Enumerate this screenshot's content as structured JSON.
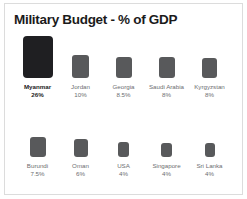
{
  "chart": {
    "title": "Military Budget - % of GDP"
  },
  "chart_data": {
    "type": "bar",
    "title": "Military Budget - % of GDP",
    "subtitle": "",
    "xlabel": "",
    "ylabel": "",
    "unit": "% of GDP",
    "grid": false,
    "legend": "none",
    "note": "Proportional-area square chart; square area scales with value. Countries arranged in two rows of five, ordered descending by value. Myanmar is highlighted in near-black; all other squares are medium gray.",
    "categories": [
      "Myanmar",
      "Jordan",
      "Georgia",
      "Saudi Arabia",
      "Kyrgyzstan",
      "Burundi",
      "Oman",
      "USA",
      "Singapore",
      "Sri Lanka"
    ],
    "values": [
      26,
      10,
      8.5,
      8,
      8,
      7.5,
      6,
      4,
      4,
      4
    ],
    "value_labels": [
      "26%",
      "10%",
      "8.5%",
      "8%",
      "8%",
      "7.5%",
      "6%",
      "4%",
      "4%",
      "4%"
    ],
    "ylim": [
      0,
      26
    ],
    "rows": [
      {
        "items": [
          {
            "label": "Myanmar",
            "value": 26,
            "value_label": "26%",
            "w": 30,
            "h": 42,
            "highlight": true
          },
          {
            "label": "Jordan",
            "value": 10,
            "value_label": "10%",
            "w": 17,
            "h": 23,
            "highlight": false
          },
          {
            "label": "Georgia",
            "value": 8.5,
            "value_label": "8.5%",
            "w": 16,
            "h": 21,
            "highlight": false
          },
          {
            "label": "Saudi Arabia",
            "value": 8,
            "value_label": "8%",
            "w": 16,
            "h": 21,
            "highlight": false
          },
          {
            "label": "Kyrgyzstan",
            "value": 8,
            "value_label": "8%",
            "w": 15,
            "h": 20,
            "highlight": false
          }
        ]
      },
      {
        "items": [
          {
            "label": "Burundi",
            "value": 7.5,
            "value_label": "7.5%",
            "w": 16,
            "h": 20,
            "highlight": false
          },
          {
            "label": "Oman",
            "value": 6,
            "value_label": "6%",
            "w": 14,
            "h": 18,
            "highlight": false
          },
          {
            "label": "USA",
            "value": 4,
            "value_label": "4%",
            "w": 11,
            "h": 15,
            "highlight": false
          },
          {
            "label": "Singapore",
            "value": 4,
            "value_label": "4%",
            "w": 11,
            "h": 14,
            "highlight": false
          },
          {
            "label": "Sri Lanka",
            "value": 4,
            "value_label": "4%",
            "w": 10,
            "h": 14,
            "highlight": false
          }
        ]
      }
    ],
    "colors": {
      "square": "#58595b",
      "square_highlight": "#1f1f22",
      "title": "#1b1b1b",
      "label": "#6d6e71",
      "background": "#ffffff",
      "border": "#dcdcdc"
    }
  }
}
